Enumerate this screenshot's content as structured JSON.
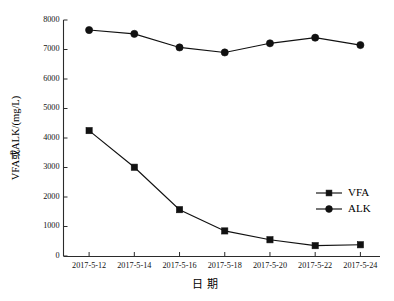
{
  "chart_data": {
    "type": "line",
    "title": "",
    "xlabel": "日 期",
    "ylabel": "VFA或ALK/(mg/L)",
    "categories": [
      "2017-5-12",
      "2017-5-14",
      "2017-5-16",
      "2017-5-18",
      "2017-5-20",
      "2017-5-22",
      "2017-5-24"
    ],
    "series": [
      {
        "name": "VFA",
        "marker": "square",
        "values": [
          4250,
          3010,
          1570,
          850,
          550,
          350,
          380
        ]
      },
      {
        "name": "ALK",
        "marker": "circle",
        "values": [
          7660,
          7530,
          7070,
          6900,
          7210,
          7400,
          7150
        ]
      }
    ],
    "ylim": [
      0,
      8000
    ],
    "yticks": [
      0,
      1000,
      2000,
      3000,
      4000,
      5000,
      6000,
      7000,
      8000
    ],
    "ytick_labels": [
      "0",
      "1000",
      "2000",
      "3000",
      "4000",
      "5000",
      "6000",
      "7000",
      "8000"
    ],
    "grid": false,
    "legend_position": "center-right",
    "legend": [
      "VFA",
      "ALK"
    ],
    "colors": {
      "series": "#111111",
      "axis": "#2b2b2b",
      "background": "#ffffff"
    }
  }
}
